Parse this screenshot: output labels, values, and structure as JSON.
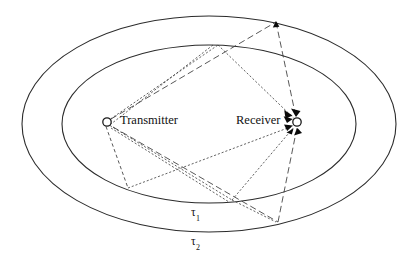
{
  "figure": {
    "background_color": "#ffffff",
    "line_color": "#2b2b2b",
    "ray_color": "#3a3a3a",
    "marker_fill": "#ffffff",
    "marker_stroke": "#1a1a1a",
    "arrow_color": "#0a0a0a",
    "width": 411,
    "height": 261
  },
  "nodes": {
    "transmitter": {
      "label": "Transmitter",
      "x": 107,
      "y": 122,
      "radius": 4.2,
      "marker": "open-circle"
    },
    "receiver": {
      "label": "Receiver",
      "x": 297,
      "y": 122,
      "radius": 4.2,
      "marker": "open-circle"
    }
  },
  "ellipses": [
    {
      "name": "inner-ellipse",
      "delay_label": "τ",
      "delay_subscript": "1",
      "cx": 209,
      "cy": 124,
      "rx": 147,
      "ry": 79
    },
    {
      "name": "outer-ellipse",
      "delay_label": "τ",
      "delay_subscript": "2",
      "cx": 209,
      "cy": 124,
      "rx": 187,
      "ry": 108
    }
  ],
  "delay_labels": [
    {
      "name": "tau-1-label",
      "symbol": "τ",
      "subscript": "1",
      "x": 191,
      "y": 207
    },
    {
      "name": "tau-2-label",
      "symbol": "τ",
      "subscript": "2",
      "x": 191,
      "y": 236
    }
  ],
  "scatterers": [
    {
      "name": "scatterer-inner-top",
      "ring": "inner",
      "x": 218,
      "y": 45
    },
    {
      "name": "scatterer-inner-bottom-left",
      "ring": "inner",
      "x": 128,
      "y": 188
    },
    {
      "name": "scatterer-inner-bottom-mid",
      "ring": "inner",
      "x": 232,
      "y": 200
    },
    {
      "name": "scatterer-outer-top",
      "ring": "outer",
      "x": 276,
      "y": 22
    },
    {
      "name": "scatterer-outer-bottom",
      "ring": "outer",
      "x": 278,
      "y": 222
    }
  ],
  "paths": [
    {
      "name": "path-tx-inner-top",
      "style": "dotted",
      "from": "transmitter",
      "to": "scatterer-inner-top"
    },
    {
      "name": "path-inner-top-rx",
      "style": "dotted",
      "from": "scatterer-inner-top",
      "to": "receiver",
      "arrow": true
    },
    {
      "name": "path-tx-inner-bottom-left",
      "style": "dashed",
      "from": "transmitter",
      "to": "scatterer-inner-bottom-left"
    },
    {
      "name": "path-inner-bl-rx",
      "style": "dotted",
      "from": "scatterer-inner-bottom-left",
      "to": "receiver",
      "arrow": true
    },
    {
      "name": "path-tx-inner-bottom-mid",
      "style": "dotted",
      "from": "transmitter",
      "to": "scatterer-inner-bottom-mid"
    },
    {
      "name": "path-inner-bm-rx",
      "style": "dotted",
      "from": "scatterer-inner-bottom-mid",
      "to": "receiver",
      "arrow": true
    },
    {
      "name": "path-tx-outer-top",
      "style": "longdash",
      "from": "transmitter",
      "to": "scatterer-outer-top",
      "arrow": true
    },
    {
      "name": "path-outer-top-rx",
      "style": "longdash",
      "from": "scatterer-outer-top",
      "to": "receiver",
      "arrow": true
    },
    {
      "name": "path-tx-outer-bottom",
      "style": "longdash",
      "from": "transmitter",
      "to": "scatterer-outer-bottom",
      "arrow": true
    },
    {
      "name": "path-outer-bottom-rx",
      "style": "longdash",
      "from": "scatterer-outer-bottom",
      "to": "receiver",
      "arrow": true
    }
  ]
}
